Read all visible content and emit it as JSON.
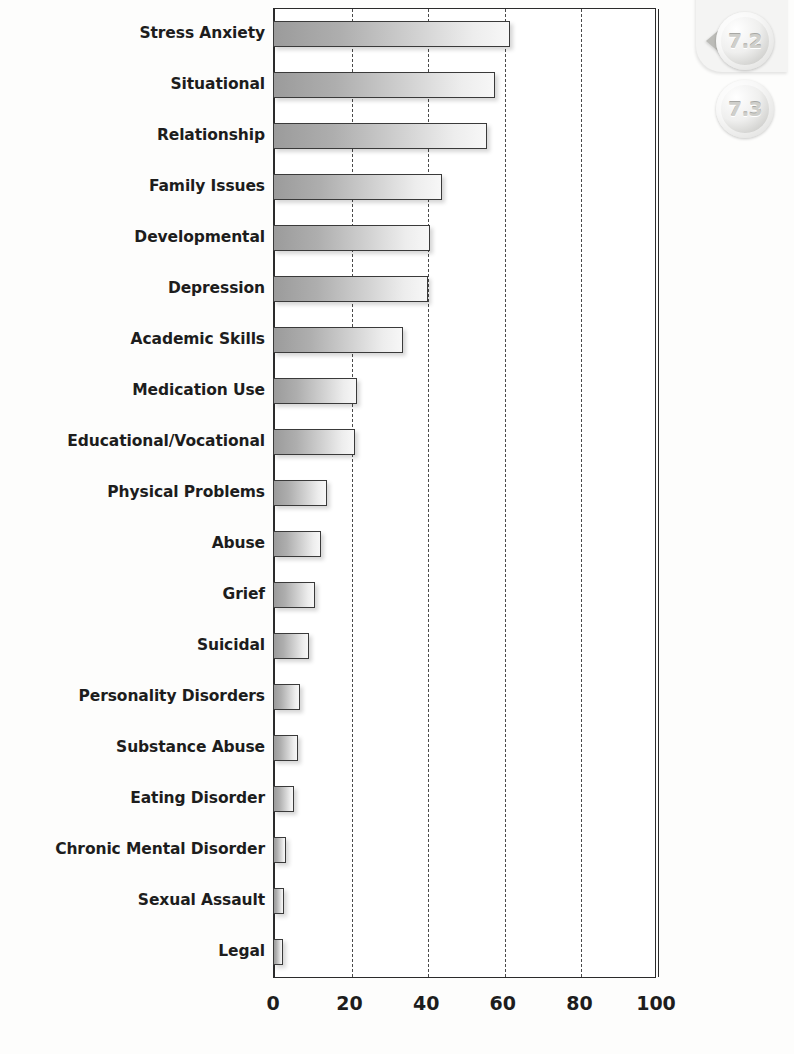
{
  "bookmarks": [
    {
      "label": "7.2",
      "name": "bookmark-tab-7-2"
    },
    {
      "label": "7.3",
      "name": "bookmark-tab-7-3"
    }
  ],
  "chart_data": {
    "type": "bar",
    "orientation": "horizontal",
    "title": "",
    "subtitle": "",
    "xlabel": "",
    "ylabel": "",
    "xlim": [
      0,
      100
    ],
    "xticks": [
      "0",
      "20",
      "40",
      "60",
      "80",
      "100"
    ],
    "xtick_values": [
      0,
      20,
      40,
      60,
      80,
      100
    ],
    "grid": "vertical-dashed",
    "legend": "none",
    "bar_style": {
      "fill_start": "#9b9b9b",
      "fill_end": "#f7f7f7",
      "border": "#3a3a3a",
      "shadow": "#00000029"
    },
    "categories": [
      "Stress Anxiety",
      "Situational",
      "Relationship",
      "Family Issues",
      "Developmental",
      "Depression",
      "Academic Skills",
      "Medication Use",
      "Educational/Vocational",
      "Physical Problems",
      "Abuse",
      "Grief",
      "Suicidal",
      "Personality Disorders",
      "Substance Abuse",
      "Eating Disorder",
      "Chronic Mental Disorder",
      "Sexual Assault",
      "Legal"
    ],
    "values": [
      62,
      58,
      56,
      44,
      41,
      40.5,
      34,
      22,
      21.5,
      14,
      12.5,
      11,
      9.5,
      7,
      6.5,
      5.5,
      3.5,
      3,
      2.5
    ]
  }
}
